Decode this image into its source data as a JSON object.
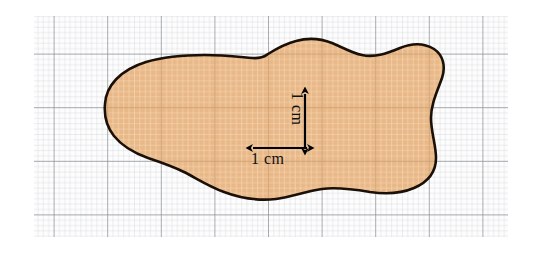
{
  "figure": {
    "background_color": "#ffffff",
    "grid": {
      "left": 34,
      "top": 16,
      "right": 508,
      "bottom": 237,
      "minor_spacing_px": 5.36,
      "major_spacing_px": 53.6,
      "minor_color": "#c9cdd1",
      "major_color": "#8b9095",
      "paper_color": "#fdfdfd"
    },
    "shape": {
      "name": "irregular-blob",
      "fill_color": "#e9b888",
      "fill_color_light": "#f3d2ae",
      "outline_color": "#1a1008",
      "outline_width_px": 2.6,
      "path": "M 105 104 C 106 86 120 70 146 62 C 166 56 185 55 205 55 C 224 55 240 57 252 58 C 262 59 265 56 268 54 C 276 49 284 44 296 41 C 310 37 322 39 332 43 C 344 48 352 53 362 55 C 375 58 388 53 400 48 C 412 43 424 43 434 49 C 443 55 446 66 442 78 C 437 92 431 104 431 118 C 431 132 436 145 436 158 C 436 172 428 182 414 188 C 400 194 384 194 370 192 C 352 189 336 187 322 189 C 306 191 292 197 276 199 C 258 201 240 198 224 192 C 208 186 196 178 184 172 C 172 166 160 162 148 158 C 134 153 122 146 114 136 C 106 126 104 115 105 104 Z"
    },
    "annotations": {
      "horizontal": {
        "label": "1 cm",
        "x1": 253,
        "x2": 307,
        "y": 148
      },
      "vertical": {
        "label": "1 cm",
        "x": 305,
        "y1": 94,
        "y2": 148
      },
      "arrow_color": "#000000"
    }
  }
}
